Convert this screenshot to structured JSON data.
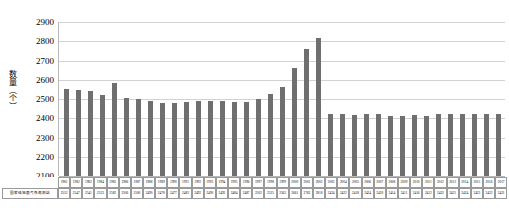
{
  "chart_data": {
    "type": "bar",
    "title": "",
    "xlabel": "",
    "ylabel": "数量（个）",
    "ylim": [
      2100,
      2900
    ],
    "yticks": [
      2900,
      2800,
      2700,
      2600,
      2500,
      2400,
      2300,
      2200,
      2100
    ],
    "grid": true,
    "legend": false,
    "series_name": "国家级地面气象观测站",
    "categories": [
      "1981",
      "1982",
      "1983",
      "1984",
      "1985",
      "1986",
      "1987",
      "1988",
      "1989",
      "1990",
      "1991",
      "1992",
      "1993",
      "1994",
      "1995",
      "1996",
      "1997",
      "1998",
      "1999",
      "2000",
      "2001",
      "2002",
      "2003",
      "2004",
      "2005",
      "2006",
      "2007",
      "2008",
      "2009",
      "2010",
      "2011",
      "2012",
      "2013",
      "2014",
      "2015",
      "2016",
      "2017"
    ],
    "values": [
      2552,
      2547,
      2541,
      2523,
      2582,
      2506,
      2500,
      2490,
      2478,
      2477,
      2482,
      2492,
      2490,
      2492,
      2484,
      2487,
      2502,
      2525,
      2563,
      2661,
      2762,
      2818,
      2424,
      2422,
      2418,
      2424,
      2420,
      2414,
      2411,
      2416,
      2412,
      2422,
      2421,
      2424,
      2423,
      2422,
      2421
    ]
  },
  "table": {
    "row_header_label": "国家级地面气象观测站"
  },
  "axis": {
    "y_title": "数量（个）"
  }
}
